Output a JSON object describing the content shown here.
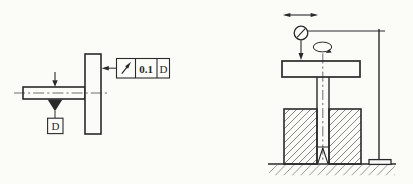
{
  "palette": {
    "paper": "#fbfbf8",
    "ink": "#2a2a2a"
  },
  "left_drawing": {
    "feature_control_frame": {
      "symbol_icon": "circular-runout-icon",
      "tolerance": "0.1",
      "datum": "D"
    },
    "datum_box_label": "D"
  },
  "right_drawing": {
    "icons": [
      "traverse-arrow-icon",
      "dial-indicator-icon",
      "probe-arrow-icon",
      "rotation-arrow-icon"
    ]
  }
}
